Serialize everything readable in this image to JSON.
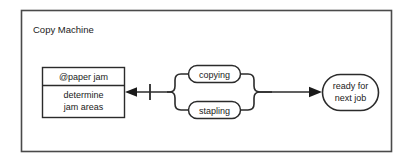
{
  "diagram": {
    "kind": "activity-diagram",
    "title": "Copy Machine",
    "background_color": "#ffffff",
    "frame_stroke_color": "#4a4a4a",
    "shape_stroke_color": "#2b2b2b",
    "text_color": "#1a1a1a",
    "state_node": {
      "header_label": "@paper jam",
      "body_line1": "determine",
      "body_line2": "jam areas"
    },
    "branches": [
      {
        "label": "copying"
      },
      {
        "label": "stapling"
      }
    ],
    "final_node": {
      "line1": "ready for",
      "line2": "next job"
    },
    "connectors": {
      "left_arrow_name": "arrow-to-paper-jam",
      "right_arrow_name": "arrow-to-ready-for-next-job",
      "bar_marker_name": "transition-bar-marker"
    }
  }
}
